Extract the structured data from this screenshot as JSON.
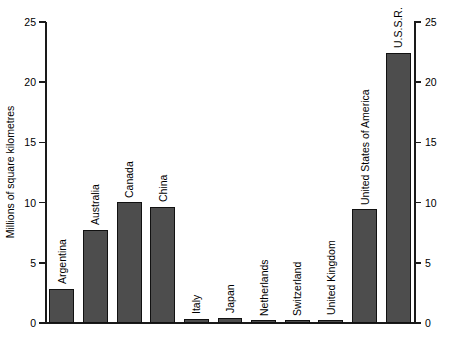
{
  "chart_data": {
    "type": "bar",
    "title": "",
    "xlabel": "",
    "ylabel": "Millions of square kilometres",
    "ylim": [
      0,
      25
    ],
    "yticks": [
      0,
      5,
      10,
      15,
      20,
      25
    ],
    "ytick_labels": [
      "0",
      "5",
      "10",
      "15",
      "20",
      "25"
    ],
    "right_axis": {
      "visible": true,
      "ticks": [
        0,
        5,
        10,
        15,
        20,
        25
      ],
      "tick_labels": [
        "0",
        "5",
        "10",
        "15",
        "20",
        "25"
      ]
    },
    "grid": false,
    "legend": null,
    "bar_color": "#4d4d4d",
    "bar_edge_color": "#111111",
    "label_orientation": "vertical",
    "categories": [
      "Argentina",
      "Australia",
      "Canada",
      "China",
      "Italy",
      "Japan",
      "Netherlands",
      "Switzerland",
      "United Kingdom",
      "United States of America",
      "U.S.S.R."
    ],
    "values": [
      2.8,
      7.7,
      10.0,
      9.6,
      0.3,
      0.4,
      0.04,
      0.04,
      0.24,
      9.4,
      22.4
    ]
  }
}
